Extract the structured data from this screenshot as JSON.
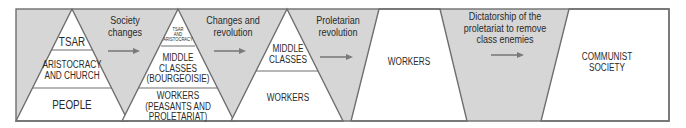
{
  "colors": {
    "stroke": "#6e6e6e",
    "gray_fill": "#d6d6d6",
    "white_fill": "#ffffff",
    "text": "#2a2a2a",
    "arrow": "#7a7a7a"
  },
  "stages": [
    {
      "id": "tsarist-society",
      "shape": "pyramid",
      "layers": [
        "TSAR",
        "ARISTOCRACY\nAND CHURCH",
        "PEOPLE"
      ]
    },
    {
      "id": "bourgeois-society",
      "shape": "pyramid",
      "layers": [
        "TSAR\nAND\nARISTOCRACY",
        "MIDDLE\nCLASSES\n(BOURGEOISIE)",
        "WORKERS\n(PEASANTS AND\nPROLETARIAT)"
      ]
    },
    {
      "id": "post-revolution-society",
      "shape": "pyramid",
      "layers": [
        "MIDDLE\nCLASSES",
        "WORKERS"
      ]
    },
    {
      "id": "workers-society",
      "shape": "box",
      "layers": [
        "WORKERS"
      ]
    },
    {
      "id": "communist-society",
      "shape": "box",
      "layers": [
        "COMMUNIST\nSOCIETY"
      ]
    }
  ],
  "transitions": [
    {
      "label": "Society\nchanges",
      "arrow": "right-arrow"
    },
    {
      "label": "Changes and\nrevolution",
      "arrow": "right-arrow"
    },
    {
      "label": "Proletarian\nrevolution",
      "arrow": "right-arrow"
    },
    {
      "label": "Dictatorship of the\nproletariat to remove\nclass enemies",
      "arrow": "right-arrow"
    }
  ]
}
